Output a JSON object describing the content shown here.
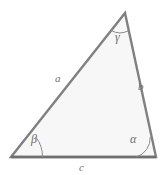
{
  "figure": {
    "kind": "scalene-triangle-diagram",
    "canvas": {
      "width": 166,
      "height": 175
    },
    "background_color": "#ffffff",
    "fill_color": "#f7f7f7",
    "stroke_color": "#808080",
    "base_stroke_color": "#6f6f6f",
    "arc_color": "#8a8a8a",
    "label_color": "#6e6e6e",
    "stroke_width": 2.4,
    "arc_width": 1,
    "vertices": {
      "apex": {
        "x": 125,
        "y": 13
      },
      "bottom_left": {
        "x": 11,
        "y": 157
      },
      "bottom_right": {
        "x": 156,
        "y": 157
      }
    },
    "polygon_points": "125,13 11,157 156,157"
  },
  "labels": {
    "side_a": "a",
    "side_b": "b",
    "side_c": "c",
    "angle_alpha": "α",
    "angle_beta": "β",
    "angle_gamma": "γ"
  },
  "arcs": {
    "alpha": {
      "path": "M 136.2 157 A 19.8 19.8 0 0 0 150.2 136.9",
      "vertex": "bottom_right"
    },
    "beta": {
      "path": "M 42.5 157 A 31.5 31.5 0 0 0 35.9 137.2",
      "vertex": "bottom_left"
    },
    "gamma": {
      "path": "M 111.4 30.6 A 18 18 0 0 0 128.5 30.7",
      "vertex": "apex"
    }
  }
}
